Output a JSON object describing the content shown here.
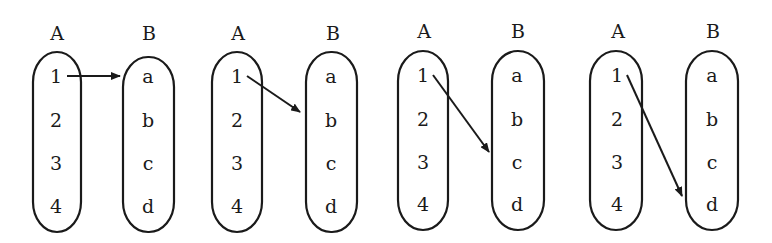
{
  "diagram": {
    "panels": [
      {
        "domain_label": "A",
        "codomain_label": "B",
        "domain": [
          "1",
          "2",
          "3",
          "4"
        ],
        "codomain": [
          "a",
          "b",
          "c",
          "d"
        ],
        "mapping": {
          "from": "1",
          "to": "a"
        }
      },
      {
        "domain_label": "A",
        "codomain_label": "B",
        "domain": [
          "1",
          "2",
          "3",
          "4"
        ],
        "codomain": [
          "a",
          "b",
          "c",
          "d"
        ],
        "mapping": {
          "from": "1",
          "to": "b"
        }
      },
      {
        "domain_label": "A",
        "codomain_label": "B",
        "domain": [
          "1",
          "2",
          "3",
          "4"
        ],
        "codomain": [
          "a",
          "b",
          "c",
          "d"
        ],
        "mapping": {
          "from": "1",
          "to": "c"
        }
      },
      {
        "domain_label": "A",
        "codomain_label": "B",
        "domain": [
          "1",
          "2",
          "3",
          "4"
        ],
        "codomain": [
          "a",
          "b",
          "c",
          "d"
        ],
        "mapping": {
          "from": "1",
          "to": "d"
        }
      }
    ]
  }
}
